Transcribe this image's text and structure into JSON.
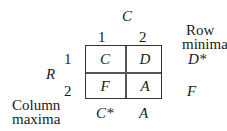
{
  "column_player": "C",
  "row_player": "R",
  "column_headers": [
    "1",
    "2"
  ],
  "row_headers": [
    "1",
    "2"
  ],
  "matrix": [
    [
      "C",
      "D"
    ],
    [
      "F",
      "A"
    ]
  ],
  "row_minima": {
    "label_line1": "Row",
    "label_line2": "minima",
    "values": [
      "D*",
      "F"
    ]
  },
  "column_maxima": {
    "label_line1": "Column",
    "label_line2": "maxima",
    "values": [
      "C*",
      "A"
    ]
  }
}
